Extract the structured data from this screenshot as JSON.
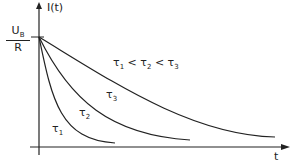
{
  "diagram": {
    "y_axis_label": "I(t)",
    "x_axis_label": "t",
    "initial_value": {
      "numerator": "U",
      "numerator_sub": "B",
      "denominator": "R"
    },
    "relation": {
      "parts": [
        "τ",
        "1",
        " < τ",
        "2",
        " < τ",
        "3"
      ]
    },
    "curves": [
      {
        "name": "τ",
        "sub": "1",
        "path": "M39,37 C52,100 60,140 115,143"
      },
      {
        "name": "τ",
        "sub": "2",
        "path": "M39,37 C70,100 110,135 190,140"
      },
      {
        "name": "τ",
        "sub": "3",
        "path": "M39,37 C110,80 190,135 275,137"
      }
    ],
    "line_color": "#222222"
  }
}
